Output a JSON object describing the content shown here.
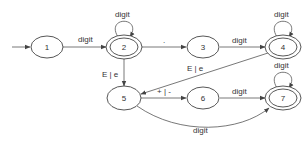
{
  "diagram": {
    "type": "finite-automaton",
    "nodes": [
      {
        "id": "1",
        "label": "1",
        "accepting": false,
        "start": true
      },
      {
        "id": "2",
        "label": "2",
        "accepting": true
      },
      {
        "id": "3",
        "label": "3",
        "accepting": false
      },
      {
        "id": "4",
        "label": "4",
        "accepting": true
      },
      {
        "id": "5",
        "label": "5",
        "accepting": false
      },
      {
        "id": "6",
        "label": "6",
        "accepting": false
      },
      {
        "id": "7",
        "label": "7",
        "accepting": true
      }
    ],
    "edges": [
      {
        "from": "1",
        "to": "2",
        "label": "digit"
      },
      {
        "from": "2",
        "to": "2",
        "label": "digit"
      },
      {
        "from": "2",
        "to": "3",
        "label": "."
      },
      {
        "from": "3",
        "to": "4",
        "label": "digit"
      },
      {
        "from": "4",
        "to": "4",
        "label": "digit"
      },
      {
        "from": "2",
        "to": "5",
        "label": "E | e"
      },
      {
        "from": "4",
        "to": "5",
        "label": "E | e"
      },
      {
        "from": "5",
        "to": "6",
        "label": "+ | -"
      },
      {
        "from": "6",
        "to": "7",
        "label": "digit"
      },
      {
        "from": "7",
        "to": "7",
        "label": "digit"
      },
      {
        "from": "5",
        "to": "7",
        "label": "digit"
      }
    ]
  }
}
